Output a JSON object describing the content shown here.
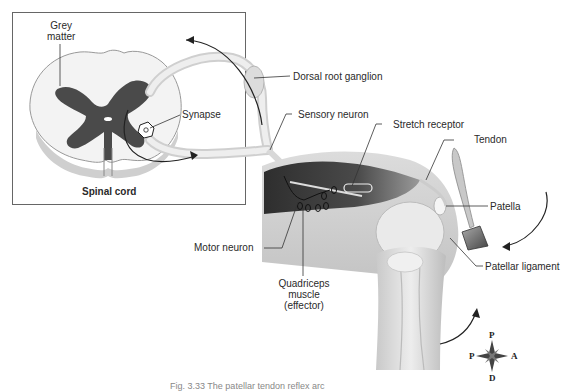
{
  "figure": {
    "caption": "Fig. 3.33 The patellar tendon reflex arc",
    "inset_title": "Spinal cord"
  },
  "labels": {
    "grey_matter": "Grey matter",
    "grey_matter_line1": "Grey",
    "grey_matter_line2": "matter",
    "synapse": "Synapse",
    "dorsal_root_ganglion": "Dorsal root ganglion",
    "sensory_neuron": "Sensory neuron",
    "stretch_receptor": "Stretch receptor",
    "tendon": "Tendon",
    "patella": "Patella",
    "motor_neuron": "Motor neuron",
    "quadriceps_line1": "Quadriceps",
    "quadriceps_line2": "muscle",
    "quadriceps_line3": "(effector)",
    "patellar_ligament": "Patellar ligament"
  },
  "compass": {
    "top": "P",
    "left": "P",
    "right": "A",
    "bottom": "D"
  },
  "colors": {
    "grey_matter": "#4a4a4a",
    "white_matter": "#f2f2f2",
    "muscle_dark": "#3a3a3a",
    "bone_light": "#e8e8e8",
    "outline": "#555555"
  }
}
